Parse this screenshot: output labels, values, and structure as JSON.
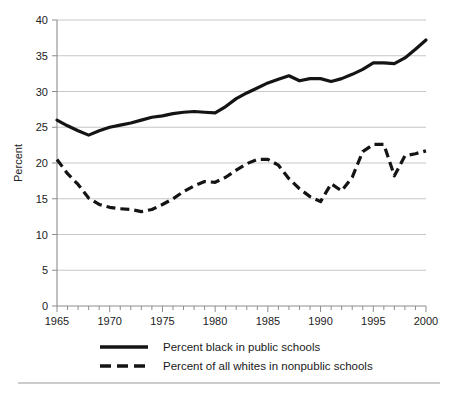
{
  "chart_data": {
    "type": "line",
    "title": "",
    "xlabel": "",
    "ylabel": "Percent",
    "xlim": [
      1965,
      2000
    ],
    "ylim": [
      0,
      40
    ],
    "grid": true,
    "legend_position": "bottom",
    "x_ticks": [
      1965,
      1970,
      1975,
      1980,
      1985,
      1990,
      1995,
      2000
    ],
    "x_minor_tick_step": 1,
    "y_ticks": [
      0,
      5,
      10,
      15,
      20,
      25,
      30,
      35,
      40
    ],
    "x": [
      1965,
      1966,
      1967,
      1968,
      1969,
      1970,
      1971,
      1972,
      1973,
      1974,
      1975,
      1976,
      1977,
      1978,
      1979,
      1980,
      1981,
      1982,
      1983,
      1984,
      1985,
      1986,
      1987,
      1988,
      1989,
      1990,
      1991,
      1992,
      1993,
      1994,
      1995,
      1996,
      1997,
      1998,
      1999,
      2000
    ],
    "series": [
      {
        "name": "Percent black in public schools",
        "style": "solid",
        "color": "#141414",
        "values": [
          26.0,
          25.2,
          24.5,
          23.9,
          24.5,
          25.0,
          25.3,
          25.6,
          26.0,
          26.4,
          26.6,
          26.9,
          27.1,
          27.2,
          27.1,
          27.0,
          27.9,
          29.0,
          29.8,
          30.5,
          31.2,
          31.7,
          32.2,
          31.5,
          31.8,
          31.8,
          31.4,
          31.8,
          32.4,
          33.1,
          34.0,
          34.0,
          33.9,
          34.7,
          35.9,
          37.2
        ]
      },
      {
        "name": "Percent of all whites in nonpublic schools",
        "style": "dashed",
        "color": "#141414",
        "values": [
          20.5,
          18.5,
          17.0,
          15.1,
          14.2,
          13.8,
          13.6,
          13.5,
          13.2,
          13.5,
          14.2,
          15.0,
          16.0,
          16.8,
          17.4,
          17.3,
          18.0,
          19.0,
          19.9,
          20.5,
          20.5,
          19.7,
          17.8,
          16.4,
          15.3,
          14.6,
          17.1,
          16.1,
          18.0,
          21.6,
          22.6,
          22.6,
          18.2,
          21.0,
          21.3,
          21.7
        ]
      }
    ]
  },
  "legend": {
    "entries": [
      {
        "label": "Percent black in public schools",
        "style": "solid"
      },
      {
        "label": "Percent of all whites in nonpublic schools",
        "style": "dashed"
      }
    ]
  },
  "axis": {
    "y_title": "Percent",
    "y_tick_labels": [
      "40",
      "35",
      "30",
      "25",
      "20",
      "15",
      "10",
      "5",
      "0"
    ],
    "x_tick_labels": [
      "1965",
      "1970",
      "1975",
      "1980",
      "1985",
      "1990",
      "1995",
      "2000"
    ]
  }
}
